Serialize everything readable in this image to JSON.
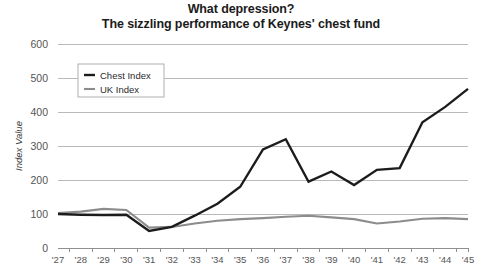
{
  "title": {
    "line1": "What depression?",
    "line2": "The sizzling performance of Keynes' chest fund"
  },
  "chart_data": {
    "type": "line",
    "title": "What depression? The sizzling performance of Keynes' chest fund",
    "xlabel": "",
    "ylabel": "Index Value",
    "ylim": [
      0,
      600
    ],
    "yticks": [
      0,
      100,
      200,
      300,
      400,
      500,
      600
    ],
    "ytick_labels": [
      "0",
      "100",
      "200",
      "300",
      "400",
      "500",
      "600"
    ],
    "grid": true,
    "legend_position": "upper-left",
    "categories": [
      "'27",
      "'28",
      "'29",
      "'30",
      "'31",
      "'32",
      "'33",
      "'34",
      "'35",
      "'36",
      "'37",
      "'38",
      "'39",
      "'40",
      "'41",
      "'42",
      "'43",
      "'44",
      "'45"
    ],
    "series": [
      {
        "name": "Chest Index",
        "color": "#1c1c1c",
        "width": 2.4,
        "values": [
          100,
          98,
          97,
          98,
          50,
          62,
          95,
          130,
          180,
          290,
          320,
          195,
          225,
          185,
          230,
          235,
          370,
          415,
          468
        ]
      },
      {
        "name": "UK Index",
        "color": "#8c8c8c",
        "width": 2.1,
        "values": [
          103,
          107,
          115,
          112,
          60,
          62,
          72,
          80,
          85,
          88,
          92,
          95,
          90,
          85,
          72,
          78,
          86,
          88,
          85
        ]
      }
    ]
  },
  "legend": {
    "items": [
      {
        "label": "Chest Index"
      },
      {
        "label": "UK Index"
      }
    ]
  },
  "colors": {
    "chest_index": "#1c1c1c",
    "uk_index": "#8c8c8c",
    "grid": "#b9b9b9",
    "text": "#555555"
  }
}
